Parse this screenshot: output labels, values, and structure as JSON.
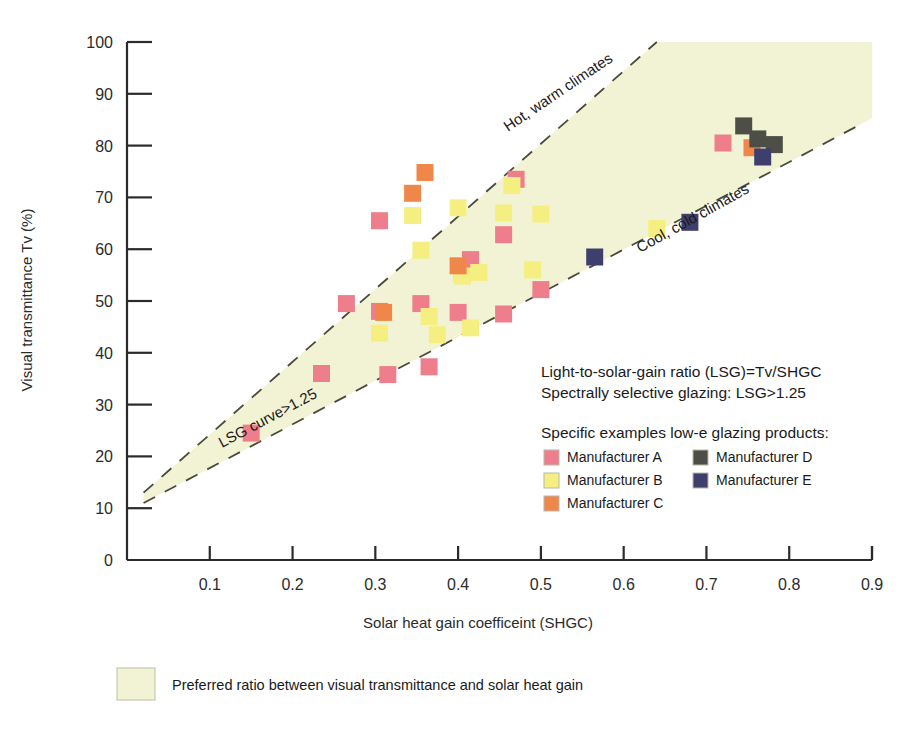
{
  "chart_data": {
    "type": "scatter",
    "title": "",
    "xlabel": "Solar heat gain coefficeint (SHGC)",
    "ylabel": "Visual transmittance Tv (%)",
    "xlim": [
      0,
      0.9
    ],
    "ylim": [
      0,
      100
    ],
    "grid": false,
    "xticks": [
      "0.1",
      "0.2",
      "0.3",
      "0.4",
      "0.5",
      "0.6",
      "0.7",
      "0.8",
      "0.9"
    ],
    "xtick_values": [
      0.1,
      0.2,
      0.3,
      0.4,
      0.5,
      0.6,
      0.7,
      0.8,
      0.9
    ],
    "yticks": [
      "0",
      "10",
      "20",
      "30",
      "40",
      "50",
      "60",
      "70",
      "80",
      "90",
      "100"
    ],
    "ytick_values": [
      0,
      10,
      20,
      30,
      40,
      50,
      60,
      70,
      80,
      90,
      100
    ],
    "legend_position": "inside-lower-right",
    "shaded_region": {
      "label": "Preferred ratio between visual transmittance and solar heat gain",
      "color": "#f2f3d4",
      "upper_bound_note": "Hot, warm climates line (LSG high)",
      "lower_bound_note": "Cool, cold climates line (LSG>1.25)"
    },
    "reference_lines": [
      {
        "name": "Hot, warm climates",
        "label": "Hot, warm climates",
        "style": "dashed",
        "x": [
          0.02,
          0.64
        ],
        "y": [
          13,
          100
        ],
        "slope_note": "upper LSG boundary"
      },
      {
        "name": "Cool, cold climates",
        "label": "Cool, cold climates",
        "style": "dashed",
        "x": [
          0.02,
          0.885
        ],
        "y": [
          11,
          84
        ],
        "slope_note": "lower LSG boundary, LSG curve>1.25"
      }
    ],
    "line_annotations": [
      {
        "text": "Hot, warm climates",
        "x": 0.47,
        "y": 90
      },
      {
        "text": "Cool, cold climates",
        "x": 0.645,
        "y": 72
      },
      {
        "text": "LSG curve>1.25",
        "x": 0.265,
        "y": 26
      }
    ],
    "series": [
      {
        "name": "Manufacturer A",
        "color": "#ef7e8c",
        "points": [
          {
            "x": 0.15,
            "y": 24.5
          },
          {
            "x": 0.235,
            "y": 36.0
          },
          {
            "x": 0.265,
            "y": 49.5
          },
          {
            "x": 0.305,
            "y": 65.5
          },
          {
            "x": 0.305,
            "y": 48.0
          },
          {
            "x": 0.315,
            "y": 35.8
          },
          {
            "x": 0.355,
            "y": 49.5
          },
          {
            "x": 0.365,
            "y": 37.3
          },
          {
            "x": 0.4,
            "y": 47.8
          },
          {
            "x": 0.405,
            "y": 55.3
          },
          {
            "x": 0.415,
            "y": 58.0
          },
          {
            "x": 0.455,
            "y": 62.8
          },
          {
            "x": 0.455,
            "y": 47.5
          },
          {
            "x": 0.47,
            "y": 73.5
          },
          {
            "x": 0.5,
            "y": 52.2
          },
          {
            "x": 0.72,
            "y": 80.5
          }
        ]
      },
      {
        "name": "Manufacturer B",
        "color": "#f5ef82",
        "points": [
          {
            "x": 0.305,
            "y": 43.8
          },
          {
            "x": 0.345,
            "y": 66.5
          },
          {
            "x": 0.355,
            "y": 59.8
          },
          {
            "x": 0.365,
            "y": 47.0
          },
          {
            "x": 0.375,
            "y": 43.5
          },
          {
            "x": 0.4,
            "y": 68.0
          },
          {
            "x": 0.405,
            "y": 54.8
          },
          {
            "x": 0.415,
            "y": 44.8
          },
          {
            "x": 0.425,
            "y": 55.5
          },
          {
            "x": 0.455,
            "y": 67.0
          },
          {
            "x": 0.465,
            "y": 72.3
          },
          {
            "x": 0.49,
            "y": 56.0
          },
          {
            "x": 0.5,
            "y": 66.8
          },
          {
            "x": 0.64,
            "y": 64.0
          }
        ]
      },
      {
        "name": "Manufacturer C",
        "color": "#f0874a",
        "points": [
          {
            "x": 0.31,
            "y": 47.8
          },
          {
            "x": 0.345,
            "y": 70.8
          },
          {
            "x": 0.36,
            "y": 74.8
          },
          {
            "x": 0.4,
            "y": 56.8
          },
          {
            "x": 0.755,
            "y": 79.6
          }
        ]
      },
      {
        "name": "Manufacturer D",
        "color": "#4d4f47",
        "points": [
          {
            "x": 0.745,
            "y": 83.8
          },
          {
            "x": 0.762,
            "y": 81.3
          },
          {
            "x": 0.782,
            "y": 80.2
          }
        ]
      },
      {
        "name": "Manufacturer E",
        "color": "#3f3f6e",
        "points": [
          {
            "x": 0.565,
            "y": 58.5
          },
          {
            "x": 0.68,
            "y": 65.2
          },
          {
            "x": 0.768,
            "y": 77.8
          }
        ]
      }
    ]
  },
  "axes": {
    "x_title": "Solar heat gain coefficeint (SHGC)",
    "y_title": "Visual transmittance Tv (%)",
    "x_tick_labels": [
      "0.1",
      "0.2",
      "0.3",
      "0.4",
      "0.5",
      "0.6",
      "0.7",
      "0.8",
      "0.9"
    ],
    "y_tick_labels": [
      "0",
      "10",
      "20",
      "30",
      "40",
      "50",
      "60",
      "70",
      "80",
      "90",
      "100"
    ]
  },
  "annotations": {
    "hot_warm": "Hot, warm climates",
    "cool_cold": "Cool, cold climates",
    "lsg_curve": "LSG curve>1.25"
  },
  "notes": {
    "line1": "Light-to-solar-gain ratio (LSG)=Tv/SHGC",
    "line2": "Spectrally selective glazing: LSG>1.25"
  },
  "legend": {
    "title": "Specific examples low-e glazing products:",
    "items": [
      {
        "label": "Manufacturer A",
        "color": "#ef7e8c"
      },
      {
        "label": "Manufacturer B",
        "color": "#f5ef82"
      },
      {
        "label": "Manufacturer C",
        "color": "#f0874a"
      },
      {
        "label": "Manufacturer D",
        "color": "#4d4f47"
      },
      {
        "label": "Manufacturer E",
        "color": "#3f3f6e"
      }
    ]
  },
  "caption": {
    "swatch_color": "#f2f3d4",
    "text": "Preferred ratio between visual transmittance and solar heat gain"
  },
  "colors": {
    "background": "#ffffff",
    "shaded_region": "#f2f3d4",
    "axis": "#2b2b2b",
    "dashed_line": "#4a4a3a"
  }
}
